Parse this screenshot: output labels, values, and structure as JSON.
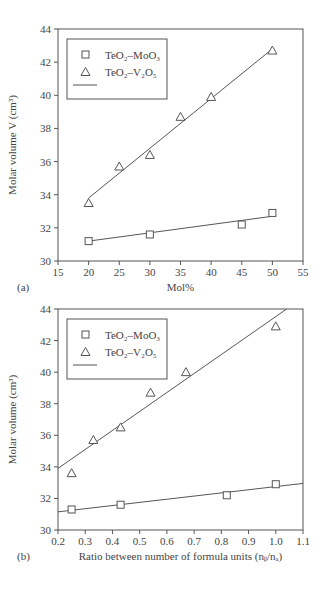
{
  "chart_data": [
    {
      "panel": "(a)",
      "type": "scatter",
      "title": "",
      "xlabel": "Mol%",
      "ylabel": "Molar volume V (cm³)",
      "xlim": [
        15,
        55
      ],
      "ylim": [
        30,
        44
      ],
      "xticks": [
        15,
        20,
        25,
        30,
        35,
        40,
        45,
        50,
        55
      ],
      "yticks": [
        30,
        32,
        34,
        36,
        38,
        40,
        42,
        44
      ],
      "grid": false,
      "legend_position": "upper left",
      "legend": [
        "TeO₂–MoO₃",
        "TeO₂–V₂O₅",
        "linear fit"
      ],
      "series": [
        {
          "name": "TeO₂–MoO₃",
          "marker": "square",
          "x": [
            20,
            30,
            45,
            50
          ],
          "y": [
            31.2,
            31.6,
            32.2,
            32.9
          ],
          "fit": [
            [
              20,
              31.2
            ],
            [
              50,
              32.7
            ]
          ]
        },
        {
          "name": "TeO₂–V₂O₅",
          "marker": "triangle",
          "x": [
            20,
            25,
            30,
            35,
            40,
            50
          ],
          "y": [
            33.5,
            35.7,
            36.4,
            38.7,
            39.9,
            42.7
          ],
          "fit": [
            [
              20,
              33.8
            ],
            [
              50,
              42.8
            ]
          ]
        }
      ]
    },
    {
      "panel": "(b)",
      "type": "scatter",
      "title": "",
      "xlabel": "Ratio between number of formula units (n_b/n_a)",
      "ylabel": "Molar volume (cm³)",
      "xlim": [
        0.2,
        1.1
      ],
      "ylim": [
        30,
        44
      ],
      "xticks": [
        0.2,
        0.3,
        0.4,
        0.5,
        0.6,
        0.7,
        0.8,
        0.9,
        1.0,
        1.1
      ],
      "yticks": [
        30,
        32,
        34,
        36,
        38,
        40,
        42,
        44
      ],
      "grid": false,
      "legend_position": "upper left",
      "legend": [
        "TeO₂–MoO₃",
        "TeO₂–V₂O₅",
        "linear fit"
      ],
      "series": [
        {
          "name": "TeO₂–MoO₃",
          "marker": "square",
          "x": [
            0.25,
            0.43,
            0.82,
            1.0
          ],
          "y": [
            31.3,
            31.6,
            32.2,
            32.9
          ],
          "fit": [
            [
              0.2,
              31.15
            ],
            [
              1.1,
              32.95
            ]
          ]
        },
        {
          "name": "TeO₂–V₂O₅",
          "marker": "triangle",
          "x": [
            0.25,
            0.33,
            0.43,
            0.54,
            0.67,
            1.0
          ],
          "y": [
            33.6,
            35.7,
            36.5,
            38.7,
            40.0,
            42.9
          ],
          "fit": [
            [
              0.2,
              33.9
            ],
            [
              1.04,
              44.0
            ]
          ]
        }
      ]
    }
  ],
  "panels": {
    "a": {
      "tag": "(a)",
      "xlabel": "Mol%",
      "ylabel": "Molar volume V (cm³)",
      "xticks": [
        "15",
        "20",
        "25",
        "30",
        "35",
        "40",
        "45",
        "50",
        "55"
      ],
      "yticks": [
        "30",
        "32",
        "34",
        "36",
        "38",
        "40",
        "42",
        "44"
      ]
    },
    "b": {
      "tag": "(b)",
      "xlabel": "Ratio between number of formula units (nᵦ/nₐ)",
      "ylabel": "Molar volume (cm³)",
      "xticks": [
        "0.2",
        "0.3",
        "0.4",
        "0.5",
        "0.6",
        "0.7",
        "0.8",
        "0.9",
        "1.0",
        "1.1"
      ],
      "yticks": [
        "30",
        "32",
        "34",
        "36",
        "38",
        "40",
        "42",
        "44"
      ]
    }
  },
  "legend": {
    "moo3": "TeO₂–MoO₃",
    "v2o5": "TeO₂–V₂O₅"
  }
}
